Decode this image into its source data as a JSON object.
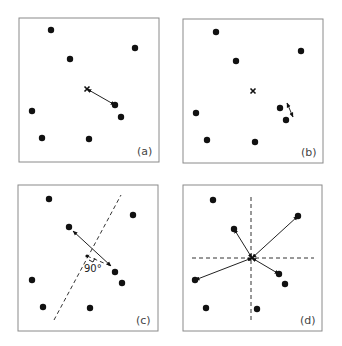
{
  "panels": [
    {
      "label": "(a)",
      "box": [
        19,
        18,
        159,
        162
      ],
      "dots": [
        [
          51,
          30
        ],
        [
          70,
          59
        ],
        [
          135,
          48
        ],
        [
          32,
          111
        ],
        [
          42,
          138
        ],
        [
          89,
          139
        ],
        [
          115,
          105
        ],
        [
          121,
          117
        ]
      ],
      "cross": [
        87,
        89
      ],
      "arrows": [
        {
          "from": [
            87,
            89
          ],
          "to": [
            115,
            105
          ],
          "heads": "both"
        }
      ],
      "dashed": []
    },
    {
      "label": "(b)",
      "box": [
        183,
        19,
        323,
        163
      ],
      "dots": [
        [
          216,
          32
        ],
        [
          236,
          61
        ],
        [
          301,
          51
        ],
        [
          196,
          113
        ],
        [
          207,
          140
        ],
        [
          255,
          142
        ],
        [
          280,
          108
        ],
        [
          286,
          120
        ]
      ],
      "cross": [
        253,
        91
      ],
      "arrows": [
        {
          "from": [
            287,
            103
          ],
          "to": [
            293,
            117
          ],
          "heads": "both"
        }
      ],
      "dashed": []
    },
    {
      "label": "(c)",
      "box": [
        18,
        185,
        158,
        331
      ],
      "dots": [
        [
          49,
          199
        ],
        [
          69,
          227
        ],
        [
          133,
          215
        ],
        [
          32,
          280
        ],
        [
          43,
          307
        ],
        [
          90,
          308
        ],
        [
          115,
          272
        ],
        [
          122,
          283
        ]
      ],
      "cross": null,
      "arrows": [
        {
          "from": [
            111,
            266
          ],
          "to": [
            73,
            231
          ],
          "heads": "both"
        }
      ],
      "dashed": [
        [
          54,
          320,
          121,
          195
        ],
        [
          87,
          256,
          111,
          266
        ]
      ],
      "foot": [
        87,
        256
      ],
      "angle_label": "90°"
    },
    {
      "label": "(d)",
      "box": [
        183,
        185,
        322,
        331
      ],
      "dots": [
        [
          213,
          200
        ],
        [
          234,
          229
        ],
        [
          298,
          216
        ],
        [
          195,
          280
        ],
        [
          206,
          308
        ],
        [
          257,
          309
        ],
        [
          279,
          274
        ],
        [
          285,
          284
        ]
      ],
      "cross": [
        252,
        258
      ],
      "arrows": [
        {
          "from": [
            252,
            258
          ],
          "to": [
            234,
            229
          ],
          "heads": "both"
        },
        {
          "from": [
            252,
            258
          ],
          "to": [
            298,
            216
          ],
          "heads": "both"
        },
        {
          "from": [
            252,
            258
          ],
          "to": [
            195,
            280
          ],
          "heads": "both"
        },
        {
          "from": [
            252,
            258
          ],
          "to": [
            279,
            274
          ],
          "heads": "both"
        }
      ],
      "dashed": [
        [
          251,
          197,
          251,
          322
        ],
        [
          192,
          258,
          314,
          258
        ]
      ]
    }
  ]
}
